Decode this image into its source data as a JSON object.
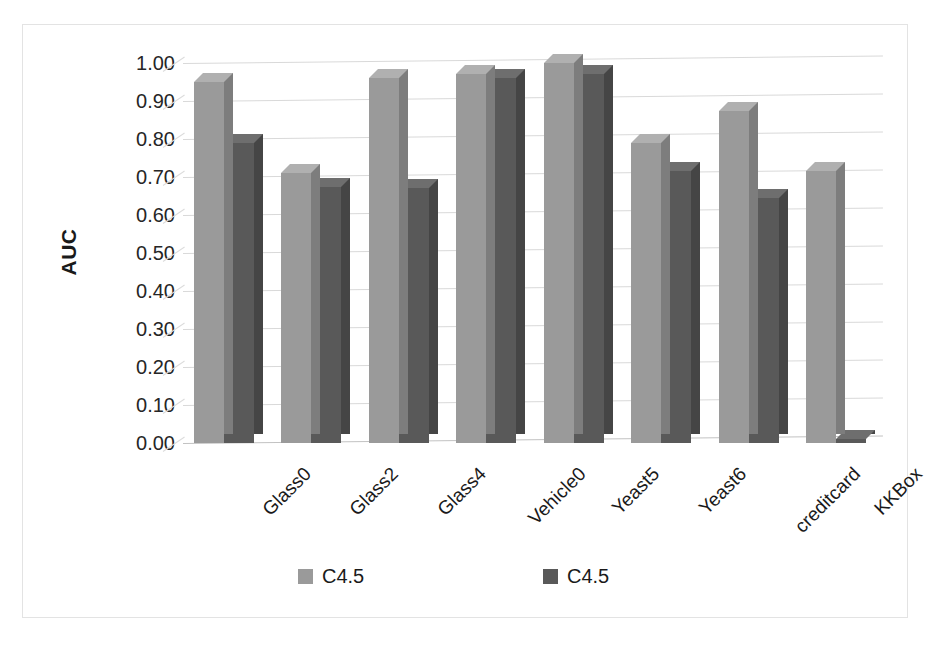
{
  "chart_data": {
    "type": "bar",
    "title": "",
    "subtitle": "",
    "xlabel": "",
    "ylabel": "AUC",
    "ylim": [
      0.0,
      1.0
    ],
    "y_tick_step": 0.1,
    "grid": true,
    "legend_position": "bottom",
    "style": "3d-clustered-column",
    "categories": [
      "Glass0",
      "Glass2",
      "Glass4",
      "Vehicle0",
      "Yeast5",
      "Yeast6",
      "creditcard",
      "KKBox"
    ],
    "y_tick_labels": [
      "1.00",
      "0.90",
      "0.80",
      "0.70",
      "0.60",
      "0.50",
      "0.40",
      "0.30",
      "0.20",
      "0.10",
      "0.00"
    ],
    "y_tick_values": [
      1.0,
      0.9,
      0.8,
      0.7,
      0.6,
      0.5,
      0.4,
      0.3,
      0.2,
      0.1,
      0.0
    ],
    "series": [
      {
        "name": "C4.5",
        "color": "#9a9a9a",
        "side_color": "#7d7d7d",
        "top_color": "#b0b0b0",
        "values": [
          0.95,
          0.71,
          0.96,
          0.97,
          1.0,
          0.79,
          0.875,
          0.715
        ]
      },
      {
        "name": "C4.5",
        "color": "#595959",
        "side_color": "#454545",
        "top_color": "#6e6e6e",
        "values": [
          0.79,
          0.675,
          0.67,
          0.96,
          0.97,
          0.715,
          0.645,
          0.01
        ]
      }
    ],
    "legend": [
      {
        "label": "C4.5",
        "color": "#9a9a9a"
      },
      {
        "label": "C4.5",
        "color": "#595959"
      }
    ],
    "colors": {
      "background": "#ffffff",
      "gridline": "#d9d9d9",
      "border": "#e3e3e3",
      "text": "#1a1a1a",
      "series_light": "#9a9a9a",
      "series_dark": "#595959"
    }
  }
}
